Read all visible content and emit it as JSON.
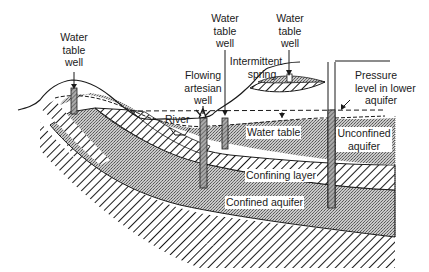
{
  "diagram": {
    "type": "hydrogeology cross-section",
    "labels": {
      "water_table_well_left": [
        "Water",
        "table",
        "well"
      ],
      "water_table_well_mid": [
        "Water",
        "table",
        "well"
      ],
      "water_table_well_right": [
        "Water",
        "table",
        "well"
      ],
      "flowing_artesian_well": [
        "Flowing",
        "artesian",
        "well"
      ],
      "intermittent_spring": [
        "Intermittent",
        "spring"
      ],
      "pressure_level": [
        "Pressure",
        "level in lower",
        "aquifer"
      ],
      "river": "River",
      "water_table": "Water table",
      "unconfined_aquifer": [
        "Unconfined",
        "aquifer"
      ],
      "confining_layer": "Confining layer",
      "confined_aquifer": "Confined aquifer"
    },
    "colors": {
      "line": "#1a1a1a",
      "aquifer_fill": "#b8b8b8",
      "background": "#ffffff"
    }
  }
}
